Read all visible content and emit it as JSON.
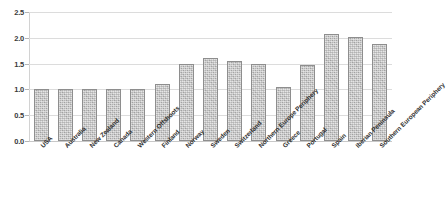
{
  "chart_data": {
    "type": "bar",
    "title": "",
    "subtitle": "",
    "xlabel": "",
    "ylabel": "",
    "ylim": [
      0.0,
      2.5
    ],
    "ytick_labels": [
      "0.0",
      "0.5",
      "1.0",
      "1.5",
      "2.0",
      "2.5"
    ],
    "ytick_values": [
      0.0,
      0.5,
      1.0,
      1.5,
      2.0,
      2.5
    ],
    "grid": "horizontal",
    "legend": "none",
    "categories": [
      "USA",
      "Australia",
      "New Zealand",
      "Canada",
      "Western Offshoots",
      "Finland",
      "Norway",
      "Sweden",
      "Switzerland",
      "Northern Europe Periphery",
      "Greece",
      "Portugal",
      "Spain",
      "Iberian Peninsula",
      "Southern European Periphery"
    ],
    "values": [
      1.0,
      1.0,
      1.0,
      1.0,
      1.0,
      1.11,
      1.5,
      1.6,
      1.55,
      1.5,
      1.05,
      1.47,
      2.08,
      2.01,
      1.88
    ],
    "series": [
      {
        "name": "",
        "values": [
          1.0,
          1.0,
          1.0,
          1.0,
          1.0,
          1.11,
          1.5,
          1.6,
          1.55,
          1.5,
          1.05,
          1.47,
          2.08,
          2.01,
          1.88
        ]
      }
    ],
    "colors": {
      "bar_fill": "#bfbfbf",
      "bar_border": "#8e8e8e",
      "gridline": "#dcdcdc",
      "axis": "#d2d2d2",
      "tick_text": "#3a3a3a",
      "background": "#ffffff"
    }
  }
}
